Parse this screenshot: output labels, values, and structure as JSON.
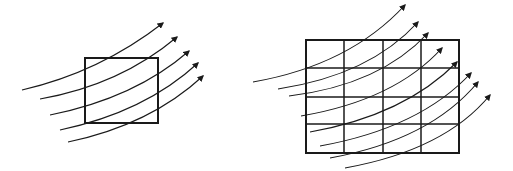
{
  "diagram": {
    "colors": {
      "stroke": "#1a1a1a",
      "background": "#ffffff"
    },
    "left_panel": {
      "shape": "square",
      "rect": {
        "x": 85,
        "y": 58,
        "w": 73,
        "h": 65
      },
      "field_lines": [
        {
          "d": "M22,90 Q100,72 163,23"
        },
        {
          "d": "M40,99 Q120,85 177,37"
        },
        {
          "d": "M50,115 Q135,98 189,51"
        },
        {
          "d": "M60,130 Q145,112 198,63"
        },
        {
          "d": "M68,142 Q150,125 203,76"
        }
      ]
    },
    "right_panel": {
      "shape": "grid",
      "rows": 4,
      "cols": 4,
      "rect": {
        "x": 306,
        "y": 40,
        "w": 153,
        "h": 113
      },
      "col_lines": [
        344,
        383,
        421
      ],
      "row_lines": [
        68,
        97,
        124
      ],
      "field_lines": [
        {
          "d": "M253,82 Q350,65 405,5"
        },
        {
          "d": "M278,89 Q370,75 418,22"
        },
        {
          "d": "M289,96 Q380,85 428,33"
        },
        {
          "d": "M301,116 Q395,100 442,48"
        },
        {
          "d": "M310,132 Q405,115 457,62"
        },
        {
          "d": "M320,146 Q420,128 471,73"
        },
        {
          "d": "M330,158 Q430,140 478,82"
        },
        {
          "d": "M345,168 Q445,150 490,95"
        }
      ]
    }
  }
}
